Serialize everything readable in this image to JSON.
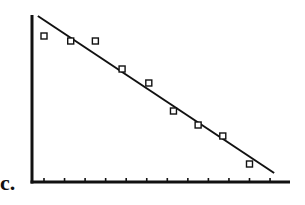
{
  "panel_label": "c.",
  "chart_data": {
    "type": "scatter",
    "title": "",
    "xlabel": "",
    "ylabel": "",
    "grid": false,
    "legend": null,
    "x_ticks_count": 12,
    "x_tick_labels": [],
    "y_tick_labels": [],
    "xlim": [
      -0.6,
      11.7
    ],
    "ylim": [
      0,
      167
    ],
    "series": [
      {
        "name": "observations",
        "marker": "hollow-square",
        "x": [
          0,
          1.3,
          2.5,
          3.8,
          5.1,
          6.3,
          7.5,
          8.7,
          10
        ],
        "y": [
          146,
          141,
          141,
          113,
          99,
          71,
          57,
          46,
          18
        ]
      }
    ],
    "fit_line": {
      "name": "linear fit",
      "x": [
        -0.3,
        11.2
      ],
      "y": [
        166,
        9
      ]
    },
    "colors": {
      "axis": "#111111",
      "line": "#111111",
      "marker": "#111111",
      "background": "#ffffff"
    }
  }
}
